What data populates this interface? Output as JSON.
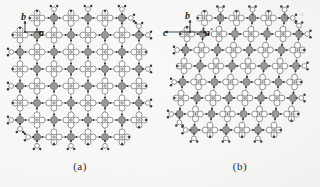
{
  "figure": {
    "kind": "crystal-packing-diagram",
    "background_color": "#fbfbfa",
    "panels": [
      {
        "id": "a",
        "caption": "(a)",
        "axes": [
          {
            "name": "b",
            "label": "b",
            "direction": "up"
          },
          {
            "name": "a",
            "label": "a",
            "direction": "right"
          }
        ],
        "projection": "view down c axis"
      },
      {
        "id": "b",
        "caption": "(b)",
        "axes": [
          {
            "name": "b",
            "label": "b",
            "direction": "up"
          },
          {
            "name": "c",
            "label": "c",
            "direction": "left"
          },
          {
            "name": "a-star",
            "label": "a",
            "superscript": "*",
            "direction": "right"
          }
        ],
        "projection": "view down a* axis"
      }
    ],
    "atoms": {
      "metal_node": {
        "role": "metal-center",
        "fill": "#9a9a9a",
        "stroke": "#555555",
        "radius": 3.6
      },
      "open_node": {
        "role": "ring-centroid-open",
        "fill": "#ffffff",
        "stroke": "#6a6a6a",
        "radius": 3.0
      },
      "small_node": {
        "role": "ligand-atom",
        "fill": "#3a3a3a",
        "stroke": "#2a2a2a",
        "radius": 1.1
      }
    },
    "bonds": {
      "stroke": "#7d7d7d",
      "width": 0.7
    },
    "chart_data": {
      "type": "scatter",
      "title": "",
      "xlabel": "",
      "ylabel": "",
      "panel_a": {
        "lattice": "square",
        "cell_x": 17,
        "cell_y": 17,
        "cols": 8,
        "rows": 8,
        "origin_x": 20,
        "origin_y": 18,
        "shear": 0
      },
      "panel_b": {
        "lattice": "oblique",
        "cell_x": 16,
        "cell_y": 16,
        "cols": 8,
        "rows": 8,
        "origin_x": 18,
        "origin_y": 18,
        "shear": 3
      }
    }
  }
}
